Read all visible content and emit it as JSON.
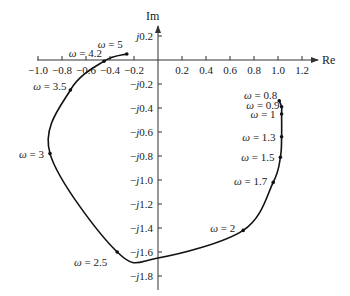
{
  "chart_data": {
    "type": "line",
    "title": "",
    "xlabel": "Re",
    "ylabel": "Im",
    "xlim": [
      -1.0,
      1.2
    ],
    "ylim": [
      -1.8,
      0.2
    ],
    "grid": false,
    "x_ticks": [
      "-1.0",
      "-0.8",
      "-0.6",
      "-0.4",
      "-0.2",
      "0.2",
      "0.4",
      "0.6",
      "0.8",
      "1.0",
      "1.2"
    ],
    "x_tick_values": [
      -1.0,
      -0.8,
      -0.6,
      -0.4,
      -0.2,
      0.2,
      0.4,
      0.6,
      0.8,
      1.0,
      1.2
    ],
    "y_ticks": [
      "j0.2",
      "-j0.2",
      "-j0.4",
      "-j0.6",
      "-j0.8",
      "-j1.0",
      "-j1.2",
      "-j1.4",
      "-j1.6",
      "-j1.8"
    ],
    "y_tick_values": [
      0.2,
      -0.2,
      -0.4,
      -0.6,
      -0.8,
      -1.0,
      -1.2,
      -1.4,
      -1.6,
      -1.8
    ],
    "series": [
      {
        "name": "Nyquist locus",
        "points": [
          {
            "omega": "0.8",
            "re": 1.01,
            "im": -0.34
          },
          {
            "omega": "0.9",
            "re": 1.03,
            "im": -0.39
          },
          {
            "omega": "1",
            "re": 1.03,
            "im": -0.45
          },
          {
            "omega": "1.3",
            "re": 1.03,
            "im": -0.64
          },
          {
            "omega": "1.5",
            "re": 1.02,
            "im": -0.81
          },
          {
            "omega": "1.7",
            "re": 0.96,
            "im": -1.02
          },
          {
            "omega": "2",
            "re": 0.71,
            "im": -1.42
          },
          {
            "omega": "",
            "re": 0.0,
            "im": -1.65
          },
          {
            "omega": "2.5",
            "re": -0.34,
            "im": -1.6
          },
          {
            "omega": "3",
            "re": -0.9,
            "im": -0.78
          },
          {
            "omega": "3.5",
            "re": -0.73,
            "im": -0.25
          },
          {
            "omega": "4.2",
            "re": -0.45,
            "im": -0.01
          },
          {
            "omega": "5",
            "re": -0.26,
            "im": 0.05
          }
        ]
      }
    ],
    "annotations": [
      "ω = 0.8",
      "ω = 0.9",
      "ω = 1",
      "ω = 1.3",
      "ω = 1.5",
      "ω = 1.7",
      "ω = 2",
      "ω = 2.5",
      "ω = 3",
      "ω = 3.5",
      "ω = 4.2",
      "ω = 5"
    ]
  },
  "axes": {
    "re_label": "Re",
    "im_label": "Im"
  },
  "colors": {
    "curve": "#111111",
    "axis": "#333333",
    "text": "#222222"
  }
}
